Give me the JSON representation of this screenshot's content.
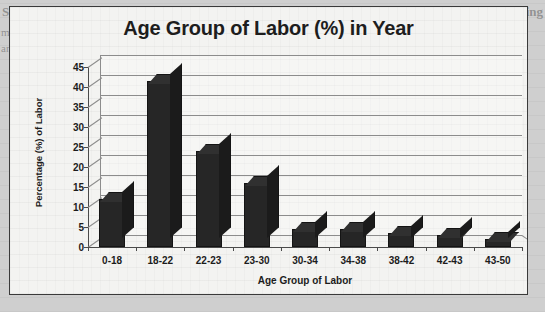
{
  "background": {
    "bleed_left_line1": "Ship Breaking Indu",
    "bleed_left_line2": "market in Indian... the ship breaking industry",
    "bleed_left_line3": "and dismantling. The labor force in this sector",
    "bleed_right_line1": "Ship Breaking"
  },
  "colors": {
    "bar": "#262626",
    "gridline": "#8c8c8c",
    "axis": "#4a4a4a",
    "plot_background": "#f3f3f1",
    "frame_border": "#3a3a3a",
    "text": "#1c1c1c"
  },
  "chart_data": {
    "type": "bar",
    "title": "Age Group of Labor (%) in Year",
    "xlabel": "Age Group of Labor",
    "ylabel": "Percentage (%) of Labor",
    "categories": [
      "0-18",
      "18-22",
      "22-23",
      "23-30",
      "30-34",
      "34-38",
      "38-42",
      "42-43",
      "43-50"
    ],
    "values": [
      12,
      41.5,
      24,
      16,
      4.5,
      4.5,
      3.5,
      3,
      2
    ],
    "ylim": [
      0,
      45
    ],
    "ytick_step": 5,
    "yticks": [
      0,
      5,
      10,
      15,
      20,
      25,
      30,
      35,
      40,
      45
    ],
    "grid": true,
    "legend": false,
    "style_3d": true
  }
}
